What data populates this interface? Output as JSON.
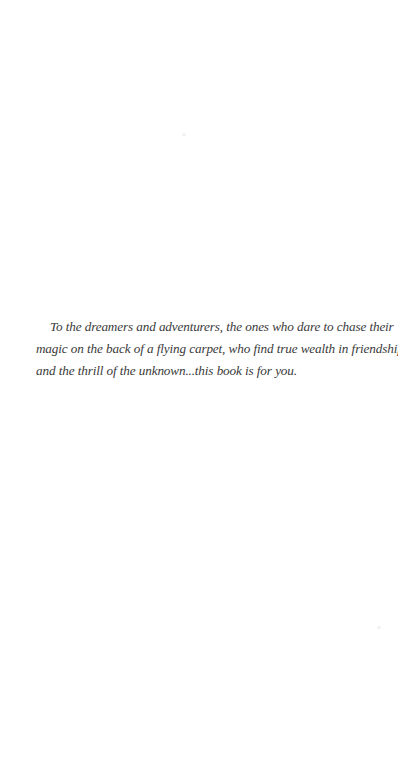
{
  "page": {
    "type": "dedication",
    "background_color": "#ffffff",
    "text_color": "#3a3a3a"
  },
  "dedication": {
    "full_text": "To the dreamers and adventurers, the ones who dare to chase their magic on the back of a flying carpet, who find true wealth in friendship and the thrill of the unknown...this book is for you.",
    "lines": [
      "To the dreamers and adventurers, the ones who dare to chase their",
      "magic on the back of a flying carpet, who find true wealth in friendship",
      "and the thrill of the unknown...this book is for you."
    ]
  }
}
